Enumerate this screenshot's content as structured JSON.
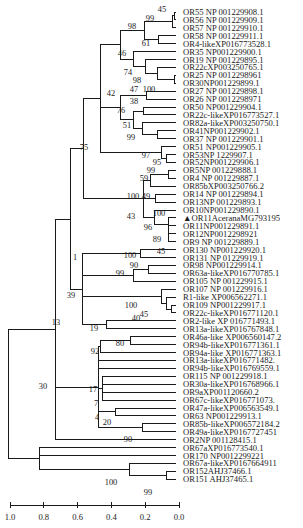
{
  "figure": {
    "type": "phylogenetic-tree",
    "scale_axis": {
      "ticks": [
        "1.0",
        "0.8",
        "0.6",
        "0.4",
        "0.2",
        "0.0"
      ],
      "range": [
        1.0,
        0.0
      ]
    },
    "highlighted_leaf_marker": "▲",
    "leaves": [
      "OR55 NP 001229908.1",
      "OR56 NP 001229909.1",
      "OR57 NP 001229910.1",
      "OR58 NP 001229911.1",
      "OR4-likeXP016773528.1",
      "OR35 NP001229900.1",
      "OR19 NP 001229895.1",
      "OR22cXP003250765.1",
      "OR25 NP 0012298961",
      "OR30NP001229899.1",
      "OR27 NP 001229898.1",
      "OR26 NP 0012298971",
      "OR50 NP001229904.1",
      "OR22c-likeXP016773527.1",
      "OR82a-likeXP003250750.1",
      "OR41NP001229902.1",
      "OR37 NP 001229901.1",
      "OR51 NP001229905.1",
      "OR53NP 1229907.1",
      "OR52NP001229906.1",
      "OR5NP 001229888.1",
      "OR4 NP 001229887.1",
      "OR85bXP003250766.2",
      "OR14 NP 001229894.1",
      "OR13NP 001229893.1",
      "OR10NP001229890.1",
      "OR11AceranaMG793195",
      "OR11NP001229891.1",
      "OR12NP0012298921",
      "OR9 NP 001229889.1",
      "OR130 NP001229920.1",
      "OR131 NP 01229919.1",
      "OR98 NP001229914.1",
      "OR63a-likeXP016770785.1",
      "OR105 NP 001229915.1",
      "OR107 NP 001229916.1",
      "R1-like XP006562271.1",
      "OR109 NP001229917.1",
      "OR22c-likeXP016771120.1",
      "OR2-like XP 016771493.1",
      "OR13a-likeXP016767848.1",
      "OR46a-like XP006560147.2",
      "OR94b-likeXP016771361.1",
      "OR94a-like XP016771363.1",
      "OR13a-likeXP016771482.",
      "OR94b-likeXP016769559.1",
      "OR115 NP 001229918.1",
      "OR30a-likeXP016768966.1",
      "OR9aXP001120660.2",
      "OR67c-likeXP016771073.",
      "OR47a-likeXP006563549.1",
      "OR63 NP001229913.1",
      "OR85b-likeXP006572184.2",
      "OR49a-likeXP0167727451",
      "OR2NP 001128415.1",
      "OR67aXP016773540.1",
      "OR170 NP0012299221",
      "OR67a-likeXP0167664911",
      "OR152AHJ37466.1",
      "OR151 AHJ37465.1"
    ],
    "highlighted_leaf_index": 26,
    "bootstrap_values": [
      {
        "value": "45",
        "near": "OR55/OR56"
      },
      {
        "value": "99",
        "near": "OR55-OR57"
      },
      {
        "value": "98",
        "near": "OR55-OR4-like"
      },
      {
        "value": "61",
        "near": "OR58/OR4-like"
      },
      {
        "value": "46",
        "near": "OR35-OR30"
      },
      {
        "value": "74",
        "near": "OR19-OR30"
      },
      {
        "value": "98",
        "near": "OR22c-OR30"
      },
      {
        "value": "100",
        "near": "OR25/OR30"
      },
      {
        "value": "42",
        "near": "OR55-OR52"
      },
      {
        "value": "47",
        "near": "OR27/OR26"
      },
      {
        "value": "38",
        "near": "OR50-OR82a"
      },
      {
        "value": "76",
        "near": "OR27-OR37"
      },
      {
        "value": "51",
        "near": "OR50-OR37"
      },
      {
        "value": "99",
        "near": "OR41/OR37"
      },
      {
        "value": "97",
        "near": "OR51-OR52"
      },
      {
        "value": "95",
        "near": "OR53/OR52"
      },
      {
        "value": "75",
        "near": "OR55-OR9"
      },
      {
        "value": "99",
        "near": "OR5/OR4"
      },
      {
        "value": "59",
        "near": "OR5-OR85b"
      },
      {
        "value": "49",
        "near": "OR14/OR13"
      },
      {
        "value": "100",
        "near": "OR5-OR9"
      },
      {
        "value": "43",
        "near": "OR10-OR9"
      },
      {
        "value": "100",
        "near": "OR11Acerana/OR11"
      },
      {
        "value": "96",
        "near": "OR11Acerana-OR9"
      },
      {
        "value": "89",
        "near": "OR12/OR9"
      },
      {
        "value": "45",
        "near": "OR9"
      },
      {
        "value": "1",
        "near": "OR55-OR13a"
      },
      {
        "value": "100",
        "near": "OR130/OR131"
      },
      {
        "value": "90",
        "near": "OR98/OR63a-like"
      },
      {
        "value": "99",
        "near": "OR98-OR105"
      },
      {
        "value": "39",
        "near": "OR130-OR13a"
      },
      {
        "value": "100",
        "near": "OR107-OR22c-like"
      },
      {
        "value": "45",
        "near": "R1-like-OR22c-like"
      },
      {
        "value": "40",
        "near": "OR109/OR22c-like"
      },
      {
        "value": "19",
        "near": "OR2-like/OR13a-like"
      },
      {
        "value": "13",
        "near": "OR55-OR2NP"
      },
      {
        "value": "80",
        "near": "OR46a/OR94b"
      },
      {
        "value": "92",
        "near": "OR46a-OR94a"
      },
      {
        "value": "17",
        "near": "OR115"
      },
      {
        "value": "7",
        "near": "OR9a"
      },
      {
        "value": "4",
        "near": "OR47a"
      },
      {
        "value": "20",
        "near": "OR47a/OR63"
      },
      {
        "value": "90",
        "near": "OR85b-like/OR49a-like"
      },
      {
        "value": "30",
        "near": "root"
      },
      {
        "value": "100",
        "near": "OR67a-like-OR151"
      },
      {
        "value": "99",
        "near": "OR152/OR151"
      }
    ]
  }
}
